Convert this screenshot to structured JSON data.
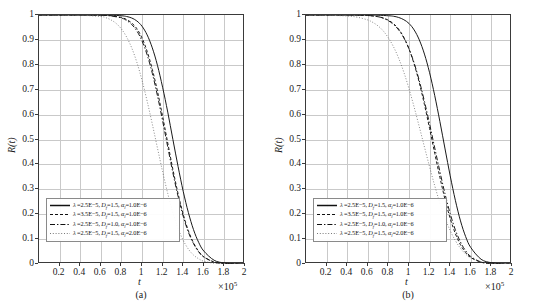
{
  "figure": {
    "panels": [
      {
        "id": "a",
        "caption": "(a)",
        "xlabel": "t",
        "ylabel": "R(t)",
        "multiplier": "×10",
        "multiplier_exp": "5"
      },
      {
        "id": "b",
        "caption": "(b)",
        "xlabel": "t",
        "ylabel": "R(t)",
        "multiplier": "×10",
        "multiplier_exp": "5"
      }
    ],
    "xticks": [
      "0.2",
      "0.4",
      "0.6",
      "0.8",
      "1",
      "1.2",
      "1.4",
      "1.6",
      "1.8",
      "2"
    ],
    "yticks": [
      "0",
      "0.1",
      "0.2",
      "0.3",
      "0.4",
      "0.5",
      "0.6",
      "0.7",
      "0.8",
      "0.9",
      "1"
    ],
    "legend": [
      {
        "style": "solid",
        "lambda": "2.5E−5",
        "df": "1.5",
        "alpha": "1.0E−6"
      },
      {
        "style": "dashed",
        "lambda": "3.5E−5",
        "df": "1.5",
        "alpha": "1.0E−6"
      },
      {
        "style": "dashdot",
        "lambda": "2.5E−5",
        "df": "1.0",
        "alpha": "1.0E−6"
      },
      {
        "style": "dotted",
        "lambda": "2.5E−5",
        "df": "1.5",
        "alpha": "2.0E−6"
      }
    ]
  },
  "chart_data": {
    "type": "line",
    "title": "",
    "xlabel": "t",
    "ylabel": "R(t)",
    "xlim": [
      0,
      2
    ],
    "ylim": [
      0,
      1
    ],
    "x_multiplier": "×10^5",
    "grid": true,
    "legend_position": "lower-left-inside",
    "panels": [
      {
        "id": "a",
        "caption": "(a)",
        "series": [
          {
            "name": "λ=2.5E−5, D_f=1.5, α_l=1.0E−6",
            "style": "solid",
            "color": "#1a1a1a",
            "x": [
              0,
              0.2,
              0.4,
              0.6,
              0.7,
              0.8,
              0.85,
              0.9,
              0.95,
              1.0,
              1.05,
              1.1,
              1.15,
              1.2,
              1.25,
              1.3,
              1.35,
              1.4,
              1.45,
              1.5,
              1.55,
              1.6,
              1.7,
              1.8,
              1.9,
              2.0
            ],
            "y": [
              1.0,
              1.0,
              1.0,
              1.0,
              0.999,
              0.997,
              0.994,
              0.988,
              0.976,
              0.955,
              0.92,
              0.868,
              0.798,
              0.71,
              0.61,
              0.5,
              0.392,
              0.292,
              0.207,
              0.138,
              0.087,
              0.052,
              0.015,
              0.004,
              0.001,
              0.0
            ]
          },
          {
            "name": "λ=3.5E−5, D_f=1.5, α_l=1.0E−6",
            "style": "dashed",
            "color": "#1a1a1a",
            "x": [
              0,
              0.2,
              0.4,
              0.6,
              0.7,
              0.8,
              0.85,
              0.9,
              0.95,
              1.0,
              1.05,
              1.1,
              1.15,
              1.2,
              1.25,
              1.3,
              1.35,
              1.4,
              1.45,
              1.5,
              1.55,
              1.6,
              1.7,
              1.8,
              1.9,
              2.0
            ],
            "y": [
              1.0,
              1.0,
              1.0,
              0.999,
              0.997,
              0.99,
              0.982,
              0.968,
              0.945,
              0.908,
              0.854,
              0.782,
              0.694,
              0.593,
              0.486,
              0.38,
              0.283,
              0.2,
              0.134,
              0.085,
              0.051,
              0.029,
              0.008,
              0.002,
              0.0,
              0.0
            ]
          },
          {
            "name": "λ=2.5E−5, D_f=1.0, α_l=1.0E−6",
            "style": "dashdot",
            "color": "#1a1a1a",
            "x": [
              0,
              0.2,
              0.4,
              0.6,
              0.7,
              0.8,
              0.85,
              0.9,
              0.95,
              1.0,
              1.05,
              1.1,
              1.15,
              1.2,
              1.25,
              1.3,
              1.35,
              1.4,
              1.45,
              1.5,
              1.55,
              1.6,
              1.7,
              1.8,
              1.9,
              2.0
            ],
            "y": [
              1.0,
              1.0,
              1.0,
              0.999,
              0.996,
              0.988,
              0.978,
              0.962,
              0.936,
              0.896,
              0.84,
              0.766,
              0.676,
              0.575,
              0.47,
              0.366,
              0.272,
              0.192,
              0.128,
              0.082,
              0.049,
              0.028,
              0.008,
              0.002,
              0.0,
              0.0
            ]
          },
          {
            "name": "λ=2.5E−5, D_f=1.5, α_l=2.0E−6",
            "style": "dotted",
            "color": "#555555",
            "x": [
              0,
              0.2,
              0.4,
              0.6,
              0.65,
              0.7,
              0.75,
              0.8,
              0.85,
              0.9,
              0.95,
              1.0,
              1.05,
              1.1,
              1.15,
              1.2,
              1.25,
              1.3,
              1.35,
              1.4,
              1.45,
              1.5,
              1.55,
              1.6,
              1.7,
              1.8,
              1.9,
              2.0
            ],
            "y": [
              1.0,
              1.0,
              0.999,
              0.994,
              0.989,
              0.98,
              0.966,
              0.944,
              0.912,
              0.868,
              0.81,
              0.738,
              0.654,
              0.562,
              0.466,
              0.371,
              0.283,
              0.206,
              0.143,
              0.095,
              0.06,
              0.036,
              0.021,
              0.011,
              0.003,
              0.001,
              0.0,
              0.0
            ]
          }
        ]
      },
      {
        "id": "b",
        "caption": "(b)",
        "series": [
          {
            "name": "λ=2.5E−5, D_f=1.5, α_l=1.0E−6",
            "style": "solid",
            "color": "#1a1a1a",
            "x": [
              0,
              0.2,
              0.4,
              0.6,
              0.7,
              0.8,
              0.85,
              0.9,
              0.95,
              1.0,
              1.05,
              1.1,
              1.15,
              1.2,
              1.25,
              1.3,
              1.35,
              1.4,
              1.45,
              1.5,
              1.55,
              1.6,
              1.7,
              1.8,
              1.9,
              2.0
            ],
            "y": [
              1.0,
              1.0,
              1.0,
              1.0,
              0.999,
              0.997,
              0.995,
              0.99,
              0.981,
              0.966,
              0.94,
              0.9,
              0.843,
              0.768,
              0.676,
              0.572,
              0.462,
              0.354,
              0.256,
              0.173,
              0.11,
              0.066,
              0.019,
              0.005,
              0.001,
              0.0
            ]
          },
          {
            "name": "λ=3.5E−5, D_f=1.5, α_l=1.0E−6",
            "style": "dashed",
            "color": "#1a1a1a",
            "x": [
              0,
              0.2,
              0.4,
              0.6,
              0.7,
              0.75,
              0.8,
              0.85,
              0.9,
              0.95,
              1.0,
              1.05,
              1.1,
              1.15,
              1.2,
              1.25,
              1.3,
              1.35,
              1.4,
              1.45,
              1.5,
              1.55,
              1.6,
              1.7,
              1.8,
              1.9,
              2.0
            ],
            "y": [
              1.0,
              1.0,
              1.0,
              0.998,
              0.993,
              0.988,
              0.979,
              0.965,
              0.943,
              0.91,
              0.864,
              0.803,
              0.728,
              0.64,
              0.544,
              0.444,
              0.348,
              0.259,
              0.183,
              0.122,
              0.077,
              0.046,
              0.026,
              0.007,
              0.002,
              0.0,
              0.0
            ]
          },
          {
            "name": "λ=2.5E−5, D_f=1.0, α_l=1.0E−6",
            "style": "dashdot",
            "color": "#1a1a1a",
            "x": [
              0,
              0.2,
              0.4,
              0.6,
              0.7,
              0.75,
              0.8,
              0.85,
              0.9,
              0.95,
              1.0,
              1.05,
              1.1,
              1.15,
              1.2,
              1.25,
              1.3,
              1.35,
              1.4,
              1.45,
              1.5,
              1.55,
              1.6,
              1.7,
              1.8,
              1.9,
              2.0
            ],
            "y": [
              1.0,
              1.0,
              1.0,
              0.998,
              0.993,
              0.987,
              0.977,
              0.962,
              0.94,
              0.908,
              0.864,
              0.807,
              0.736,
              0.653,
              0.562,
              0.466,
              0.371,
              0.281,
              0.202,
              0.137,
              0.088,
              0.053,
              0.03,
              0.008,
              0.002,
              0.0,
              0.0
            ]
          },
          {
            "name": "λ=2.5E−5, D_f=1.5, α_l=2.0E−6",
            "style": "dotted",
            "color": "#555555",
            "x": [
              0,
              0.2,
              0.4,
              0.5,
              0.6,
              0.65,
              0.7,
              0.75,
              0.8,
              0.85,
              0.9,
              0.95,
              1.0,
              1.05,
              1.1,
              1.15,
              1.2,
              1.25,
              1.3,
              1.35,
              1.4,
              1.45,
              1.5,
              1.55,
              1.6,
              1.7,
              1.8,
              1.9,
              2.0
            ],
            "y": [
              1.0,
              0.999,
              0.996,
              0.991,
              0.98,
              0.97,
              0.956,
              0.936,
              0.908,
              0.872,
              0.826,
              0.77,
              0.704,
              0.63,
              0.551,
              0.47,
              0.39,
              0.314,
              0.245,
              0.185,
              0.134,
              0.094,
              0.063,
              0.04,
              0.024,
              0.008,
              0.002,
              0.001,
              0.0
            ]
          }
        ]
      }
    ]
  }
}
